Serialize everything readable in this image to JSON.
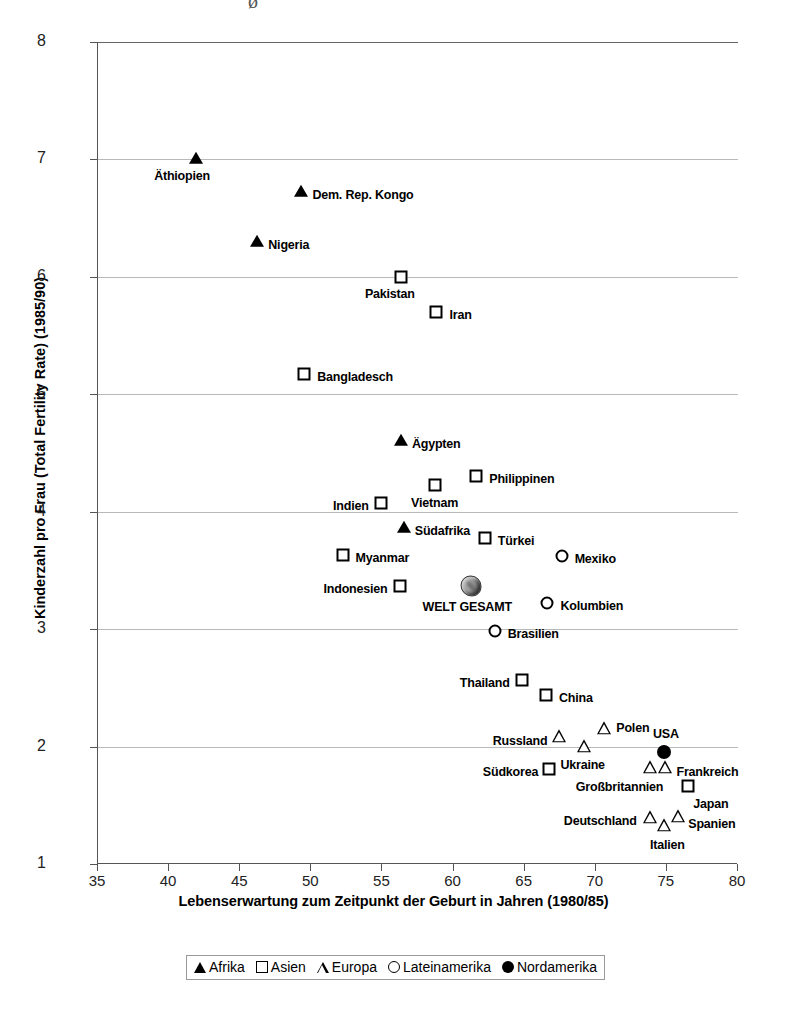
{
  "chart_data": {
    "type": "scatter",
    "title": "",
    "xlabel": "Lebenserwartung zum Zeitpunkt der Geburt in Jahren (1980/85)",
    "ylabel": "Kinderzahl pro Frau (Total Fertility Rate) (1985/90)",
    "xlim": [
      35,
      80
    ],
    "ylim": [
      1,
      8
    ],
    "xticks": [
      35,
      40,
      45,
      50,
      55,
      60,
      65,
      70,
      75,
      80
    ],
    "yticks": [
      1,
      2,
      3,
      4,
      5,
      6,
      7,
      8
    ],
    "grid": true,
    "legend_position": "bottom",
    "legend": [
      {
        "label": "Afrika",
        "marker": "filled-triangle"
      },
      {
        "label": "Asien",
        "marker": "open-square"
      },
      {
        "label": "Europa",
        "marker": "open-triangle"
      },
      {
        "label": "Lateinamerika",
        "marker": "open-circle"
      },
      {
        "label": "Nordamerika",
        "marker": "filled-circle"
      }
    ],
    "series": [
      {
        "name": "Afrika",
        "marker": "filled-triangle",
        "points": [
          {
            "label": "Äthiopien",
            "x": 41.9,
            "y": 7.0,
            "lx": -42,
            "ly": 16
          },
          {
            "label": "Dem. Rep. Kongo",
            "x": 49.3,
            "y": 6.72,
            "lx": 11,
            "ly": 2
          },
          {
            "label": "Nigeria",
            "x": 46.2,
            "y": 6.3,
            "lx": 11,
            "ly": 2
          },
          {
            "label": "Ägypten",
            "x": 56.3,
            "y": 4.6,
            "lx": 11,
            "ly": 2
          },
          {
            "label": "Südafrika",
            "x": 56.5,
            "y": 3.86,
            "lx": 11,
            "ly": 2
          }
        ]
      },
      {
        "name": "Asien",
        "marker": "open-square",
        "points": [
          {
            "label": "Pakistan",
            "x": 56.3,
            "y": 6.0,
            "lx": -36,
            "ly": 16
          },
          {
            "label": "Iran",
            "x": 58.8,
            "y": 5.7,
            "lx": 13,
            "ly": 2
          },
          {
            "label": "Bangladesch",
            "x": 49.5,
            "y": 5.17,
            "lx": 13,
            "ly": 2
          },
          {
            "label": "Philippinen",
            "x": 61.6,
            "y": 4.3,
            "lx": 13,
            "ly": 2
          },
          {
            "label": "Vietnam",
            "x": 58.7,
            "y": 4.23,
            "lx": -24,
            "ly": 17
          },
          {
            "label": "Indien",
            "x": 54.9,
            "y": 4.07,
            "lx": -48,
            "ly": 2
          },
          {
            "label": "Türkei",
            "x": 62.2,
            "y": 3.78,
            "lx": 13,
            "ly": 2
          },
          {
            "label": "Myanmar",
            "x": 52.2,
            "y": 3.63,
            "lx": 13,
            "ly": 2
          },
          {
            "label": "Indonesien",
            "x": 56.2,
            "y": 3.37,
            "lx": -76,
            "ly": 2
          },
          {
            "label": "Thailand",
            "x": 64.8,
            "y": 2.57,
            "lx": -62,
            "ly": 2
          },
          {
            "label": "China",
            "x": 66.5,
            "y": 2.44,
            "lx": 13,
            "ly": 2
          },
          {
            "label": "Südkorea",
            "x": 66.7,
            "y": 1.81,
            "lx": -66,
            "ly": 2
          },
          {
            "label": "Japan",
            "x": 76.5,
            "y": 1.66,
            "lx": 5,
            "ly": 17
          }
        ]
      },
      {
        "name": "Europa",
        "marker": "open-triangle",
        "points": [
          {
            "label": "Polen",
            "x": 70.6,
            "y": 2.15,
            "lx": 12,
            "ly": -2
          },
          {
            "label": "Russland",
            "x": 67.4,
            "y": 2.08,
            "lx": -66,
            "ly": 3
          },
          {
            "label": "Ukraine",
            "x": 69.2,
            "y": 2.0,
            "lx": -24,
            "ly": 17
          },
          {
            "label": "Frankreich",
            "x": 74.9,
            "y": 1.82,
            "lx": 11,
            "ly": 3
          },
          {
            "label": "Großbritannien",
            "x": 73.8,
            "y": 1.82,
            "lx": -74,
            "ly": 18
          },
          {
            "label": "Deutschland",
            "x": 73.8,
            "y": 1.39,
            "lx": -86,
            "ly": 2
          },
          {
            "label": "Spanien",
            "x": 75.8,
            "y": 1.4,
            "lx": 10,
            "ly": 6
          },
          {
            "label": "Italien",
            "x": 74.8,
            "y": 1.32,
            "lx": -14,
            "ly": 18
          }
        ]
      },
      {
        "name": "Lateinamerika",
        "marker": "open-circle",
        "points": [
          {
            "label": "Mexiko",
            "x": 67.6,
            "y": 3.62,
            "lx": 13,
            "ly": 2
          },
          {
            "label": "Kolumbien",
            "x": 66.6,
            "y": 3.22,
            "lx": 13,
            "ly": 2
          },
          {
            "label": "Brasilien",
            "x": 62.9,
            "y": 2.98,
            "lx": 13,
            "ly": 2
          }
        ]
      },
      {
        "name": "Nordamerika",
        "marker": "filled-circle",
        "points": [
          {
            "label": "USA",
            "x": 74.8,
            "y": 1.95,
            "lx": -11,
            "ly": -19
          }
        ]
      },
      {
        "name": "Welt",
        "marker": "globe",
        "points": [
          {
            "label": "WELT GESAMT",
            "x": 61.2,
            "y": 3.37,
            "lx": -48,
            "ly": 20
          }
        ]
      }
    ]
  },
  "top_artifact": "ø"
}
